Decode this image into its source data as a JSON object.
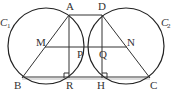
{
  "diagram": {
    "circles": [
      {
        "name": "C1",
        "label": "C",
        "subscript": "1"
      },
      {
        "name": "C2",
        "label": "C",
        "subscript": "2"
      }
    ],
    "points": {
      "A": "A",
      "B": "B",
      "C": "C",
      "D": "D",
      "M": "M",
      "N": "N",
      "P": "P",
      "Q": "Q",
      "R": "R",
      "H": "H"
    },
    "segments": [
      "AD",
      "BC",
      "AB",
      "DC",
      "MN",
      "AR",
      "DH"
    ],
    "right_angles": [
      "ARB",
      "DHC"
    ],
    "colors": {
      "stroke": "#333333",
      "background": "#ffffff"
    }
  }
}
